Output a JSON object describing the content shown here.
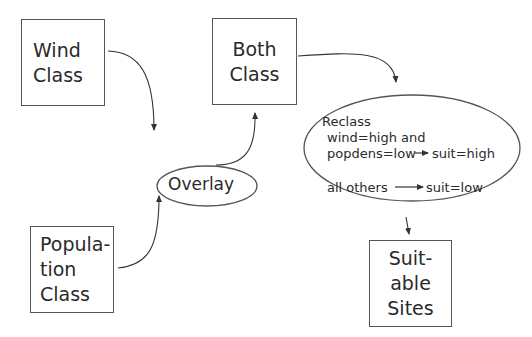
{
  "diagram": {
    "nodes": {
      "wind_class": {
        "lines": [
          "Wind",
          "Class"
        ]
      },
      "population_class": {
        "lines": [
          "Popula-",
          "tion",
          "Class"
        ]
      },
      "overlay": {
        "label": "Overlay"
      },
      "both_class": {
        "lines": [
          "Both",
          "Class"
        ]
      },
      "reclass": {
        "title": "Reclass",
        "rule1_line1": "wind=high and",
        "rule1_line2_left": "popdens=low",
        "rule1_result": "suit=high",
        "rule2_left": "all others",
        "rule2_result": "suit=low"
      },
      "suitable_sites": {
        "lines": [
          "Suit-",
          "able",
          "Sites"
        ]
      }
    },
    "edges": [
      {
        "from": "wind_class",
        "to": "overlay"
      },
      {
        "from": "population_class",
        "to": "overlay"
      },
      {
        "from": "overlay",
        "to": "both_class"
      },
      {
        "from": "both_class",
        "to": "reclass"
      },
      {
        "from": "reclass",
        "to": "suitable_sites"
      }
    ]
  }
}
